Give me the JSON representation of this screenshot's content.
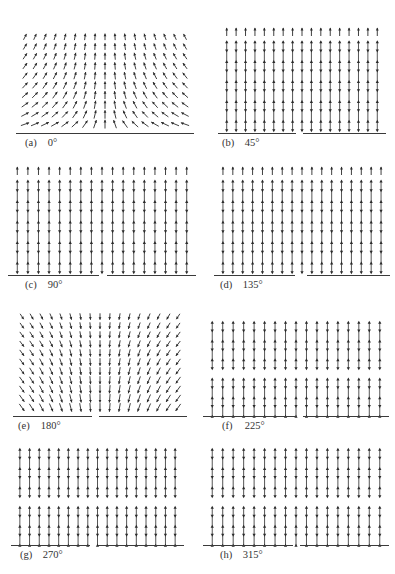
{
  "figure": {
    "panels": [
      {
        "id": "a",
        "label": "(a)",
        "angle": "0°",
        "field": "radial-sink",
        "x": 20,
        "y": 30,
        "w": 170,
        "h": 103,
        "cols": 17,
        "rows": 10,
        "baseline_gap": null,
        "caption_x": 25,
        "caption_y": 137
      },
      {
        "id": "b",
        "label": "(b)",
        "angle": "45°",
        "field": "vertical-focus",
        "x": 222,
        "y": 24,
        "w": 160,
        "h": 109,
        "cols": 17,
        "rows": 10,
        "baseline_gap": [
          296,
          303
        ],
        "caption_x": 222,
        "caption_y": 137
      },
      {
        "id": "c",
        "label": "(c)",
        "angle": "90°",
        "field": "vertical",
        "x": 12,
        "y": 163,
        "w": 180,
        "h": 112,
        "cols": 17,
        "rows": 10,
        "baseline_gap": [
          99,
          107
        ],
        "caption_x": 25,
        "caption_y": 279
      },
      {
        "id": "d",
        "label": "(d)",
        "angle": "135°",
        "field": "vertical",
        "x": 218,
        "y": 163,
        "w": 168,
        "h": 112,
        "cols": 17,
        "rows": 10,
        "baseline_gap": [
          295,
          307
        ],
        "caption_x": 220,
        "caption_y": 279
      },
      {
        "id": "e",
        "label": "(e)",
        "angle": "180°",
        "field": "radial-source",
        "x": 17,
        "y": 310,
        "w": 166,
        "h": 106,
        "cols": 17,
        "rows": 11,
        "baseline_gap": [
          92,
          99
        ],
        "caption_x": 18,
        "caption_y": 420
      },
      {
        "id": "f",
        "label": "(f)",
        "angle": "225°",
        "field": "split-curl",
        "x": 207,
        "y": 318,
        "w": 178,
        "h": 98,
        "cols": 17,
        "rows": 10,
        "baseline_gap": [
          295,
          303
        ],
        "caption_x": 222,
        "caption_y": 420
      },
      {
        "id": "g",
        "label": "(g)",
        "angle": "270°",
        "field": "split-vertical",
        "x": 15,
        "y": 445,
        "w": 165,
        "h": 100,
        "cols": 17,
        "rows": 10,
        "baseline_gap": [
          90,
          98
        ],
        "caption_x": 20,
        "caption_y": 549
      },
      {
        "id": "h",
        "label": "(h)",
        "angle": "315°",
        "field": "split-dip",
        "x": 207,
        "y": 445,
        "w": 178,
        "h": 100,
        "cols": 17,
        "rows": 10,
        "baseline_gap": [
          293,
          300
        ],
        "caption_x": 220,
        "caption_y": 549
      }
    ],
    "ink_color": "#2a2a2a",
    "baseline_color": "#3a3a3a"
  }
}
